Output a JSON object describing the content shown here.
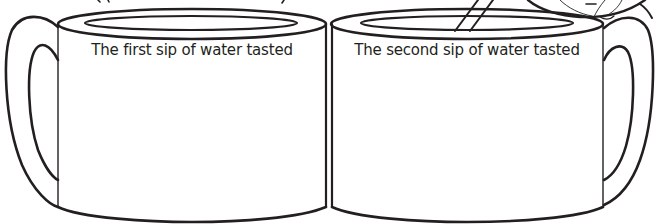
{
  "worksheet": {
    "mugs": [
      {
        "id": "first-sip",
        "prompt": "The first sip of water tasted",
        "handle_side": "left",
        "response": ""
      },
      {
        "id": "second-sip",
        "prompt": "The second sip of water tasted",
        "handle_side": "right",
        "has_straw": true,
        "has_lemon": true,
        "response": ""
      }
    ],
    "colors": {
      "line": "#231f20",
      "background": "#ffffff"
    }
  }
}
